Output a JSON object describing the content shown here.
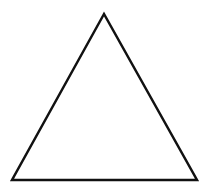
{
  "diagram": {
    "shape": "triangle",
    "type": "equilateral-outline",
    "background_color": "#ffffff",
    "stroke_color": "#111111",
    "fill_color": "none",
    "stroke_width": 2.5,
    "vertices": {
      "apex": {
        "x": 104,
        "y": 14
      },
      "bottom_left": {
        "x": 12,
        "y": 180
      },
      "bottom_right": {
        "x": 197,
        "y": 180
      }
    }
  }
}
